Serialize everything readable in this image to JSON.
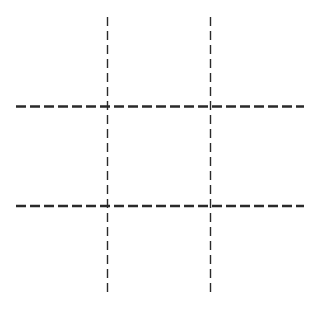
{
  "game": {
    "type": "tic-tac-toe",
    "grid_size": 3,
    "colors": {
      "background": "#ffffff",
      "line": "#2a2a2a"
    },
    "lines": {
      "vertical": [
        {
          "x": 107.5,
          "y1": 17,
          "y2": 297
        },
        {
          "x": 210.5,
          "y1": 17,
          "y2": 297
        }
      ],
      "horizontal": [
        {
          "y": 106.5,
          "x1": 16,
          "x2": 304
        },
        {
          "y": 206,
          "x1": 16,
          "x2": 304
        }
      ]
    },
    "cells": [
      [
        "",
        "",
        ""
      ],
      [
        "",
        "",
        ""
      ],
      [
        "",
        "",
        ""
      ]
    ]
  }
}
